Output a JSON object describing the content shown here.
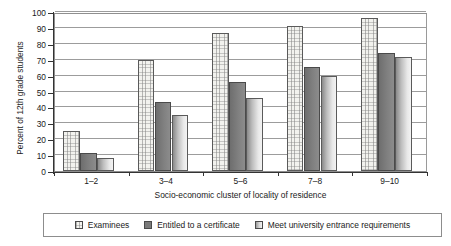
{
  "chart_data": {
    "type": "bar",
    "title": "",
    "subtitle": "",
    "xlabel": "Socio-economic cluster of locality of residence",
    "ylabel": "Percent of 12th grade students",
    "categories": [
      "1–2",
      "3–4",
      "5–6",
      "7–8",
      "9–10"
    ],
    "series": [
      {
        "name": "Examinees",
        "values": [
          25,
          70,
          87,
          91.5,
          96.5
        ],
        "color": "#f2f2ee",
        "pattern": "fine-grid"
      },
      {
        "name": "Entitled to a certificate",
        "values": [
          11.5,
          43.5,
          56,
          65.5,
          74
        ],
        "color": "#7a7a7a",
        "pattern": "solid-dark-gray"
      },
      {
        "name": "Meet university entrance requirements",
        "values": [
          8.5,
          35.5,
          46,
          59.5,
          71.5
        ],
        "color": "#dcdcdc",
        "pattern": "light-gradient"
      }
    ],
    "ylim": [
      0,
      100
    ],
    "ytick_step": 10,
    "yticks": [
      0,
      10,
      20,
      30,
      40,
      50,
      60,
      70,
      80,
      90,
      100
    ],
    "ytick_labels": [
      "0",
      "10",
      "20",
      "30",
      "40",
      "50",
      "60",
      "70",
      "80",
      "90",
      "100"
    ],
    "grid": "horizontal",
    "legend_position": "bottom",
    "legend_border": true,
    "axis_color": "#333333",
    "grid_color": "#9c9c9c"
  },
  "legend": {
    "items": [
      {
        "label": "Examinees"
      },
      {
        "label": "Entitled to a certificate"
      },
      {
        "label": "Meet university entrance requirements"
      }
    ]
  }
}
